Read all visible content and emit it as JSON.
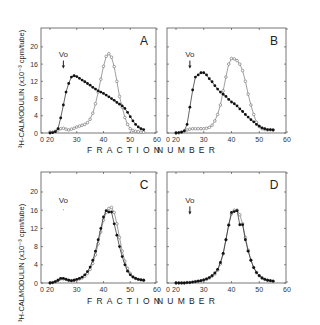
{
  "figure": {
    "xlabel_left": "FRACTION",
    "xlabel_right": "NUMBER",
    "ylabel": "³H-CALMODULIN (x10⁻³ cpm/tube)",
    "void_marker": "Vo"
  },
  "chart_data": [
    {
      "type": "line",
      "panel": "A",
      "title": "A",
      "xlabel": "FRACTION NUMBER",
      "ylabel": "3H-CALMODULIN (x10^-3 cpm/tube)",
      "xticks": [
        "0",
        "20",
        "30",
        "40",
        "50",
        "60"
      ],
      "yticks": [
        "0",
        "4",
        "8",
        "12",
        "16",
        "20"
      ],
      "xlim": [
        20,
        60
      ],
      "ylim": [
        0,
        24
      ],
      "annotation": {
        "text": "Vo",
        "x": 25,
        "arrow": true
      },
      "series": [
        {
          "name": "filled",
          "marker": "filled-circle",
          "x": [
            20,
            21,
            22,
            23,
            24,
            25,
            26,
            27,
            28,
            29,
            30,
            31,
            32,
            33,
            34,
            35,
            36,
            37,
            38,
            39,
            40,
            41,
            42,
            43,
            44,
            45,
            46,
            47,
            48,
            49,
            50,
            51,
            52,
            53,
            54,
            55
          ],
          "y": [
            0,
            0.1,
            0.3,
            1,
            3.5,
            6.5,
            9.5,
            11.5,
            13,
            13.3,
            13.1,
            12.7,
            12.3,
            11.9,
            11.5,
            11.1,
            10.6,
            10.2,
            9.8,
            9.5,
            9.2,
            8.8,
            8.4,
            8,
            7.6,
            7.1,
            6.7,
            6.3,
            5.7,
            4.8,
            3.8,
            2.8,
            2,
            1.4,
            1,
            0.8
          ]
        },
        {
          "name": "open",
          "marker": "open-circle",
          "x": [
            20,
            21,
            22,
            23,
            24,
            25,
            26,
            27,
            28,
            29,
            30,
            31,
            32,
            33,
            34,
            35,
            36,
            37,
            38,
            39,
            40,
            41,
            42,
            43,
            44,
            45,
            46,
            47,
            48,
            49,
            50,
            51,
            52,
            53,
            54,
            55
          ],
          "y": [
            0.2,
            0.2,
            0.4,
            0.7,
            1,
            1.1,
            0.9,
            0.7,
            0.9,
            1.1,
            1.4,
            1.6,
            1.8,
            2,
            2.4,
            3.2,
            4.6,
            6.8,
            9.5,
            12.5,
            15.5,
            17.8,
            18.4,
            17.6,
            15.4,
            12,
            8.5,
            6,
            3.6,
            2,
            1,
            0.6,
            0.4,
            0.3,
            0.2,
            0.2
          ]
        }
      ]
    },
    {
      "type": "line",
      "panel": "B",
      "title": "B",
      "xlabel": "FRACTION NUMBER",
      "xticks": [
        "0",
        "20",
        "30",
        "40",
        "50",
        "60"
      ],
      "xlim": [
        20,
        60
      ],
      "ylim": [
        0,
        24
      ],
      "annotation": {
        "text": "Vo",
        "x": 25,
        "arrow": true
      },
      "series": [
        {
          "name": "filled",
          "marker": "filled-circle",
          "x": [
            20,
            21,
            22,
            23,
            24,
            25,
            26,
            27,
            28,
            29,
            30,
            31,
            32,
            33,
            34,
            35,
            36,
            37,
            38,
            39,
            40,
            41,
            42,
            43,
            44,
            45,
            46,
            47,
            48,
            49,
            50,
            51,
            52,
            53,
            54,
            55
          ],
          "y": [
            0,
            0.1,
            0.2,
            0.5,
            2,
            6,
            10,
            13,
            13.5,
            14,
            14,
            13.5,
            12.6,
            11.9,
            11,
            10.2,
            9.5,
            9,
            8.5,
            7.8,
            7.2,
            6.8,
            6.3,
            5.6,
            5,
            4.3,
            3.7,
            3.1,
            2.6,
            2,
            1.6,
            1.2,
            1,
            0.8,
            0.8,
            0.7
          ]
        },
        {
          "name": "open",
          "marker": "open-circle",
          "x": [
            20,
            21,
            22,
            23,
            24,
            25,
            26,
            27,
            28,
            29,
            30,
            31,
            32,
            33,
            34,
            35,
            36,
            37,
            38,
            39,
            40,
            41,
            42,
            43,
            44,
            45,
            46,
            47,
            48,
            49,
            50,
            51,
            52,
            53,
            54,
            55
          ],
          "y": [
            0,
            0,
            0.2,
            0.4,
            0.7,
            0.9,
            1,
            1,
            1,
            1,
            1,
            1.1,
            1.3,
            1.8,
            2.8,
            4.3,
            6.5,
            9.8,
            13,
            16,
            17.3,
            17.2,
            16.8,
            16,
            14.5,
            12,
            9,
            6.5,
            4.3,
            2.5,
            1.5,
            1,
            0.8,
            0.7,
            0.7,
            0.7
          ]
        }
      ]
    },
    {
      "type": "line",
      "panel": "C",
      "title": "C",
      "xlabel": "FRACTION NUMBER",
      "ylabel": "3H-CALMODULIN (x10^-3 cpm/tube)",
      "xticks": [
        "0",
        "20",
        "30",
        "40",
        "50",
        "60"
      ],
      "yticks": [
        "0",
        "4",
        "8",
        "12",
        "16",
        "20"
      ],
      "xlim": [
        20,
        60
      ],
      "ylim": [
        0,
        24
      ],
      "annotation": {
        "text": "Vo",
        "x": 25,
        "arrow": false
      },
      "series": [
        {
          "name": "filled",
          "marker": "filled-circle",
          "x": [
            20,
            21,
            22,
            23,
            24,
            25,
            26,
            27,
            28,
            29,
            30,
            31,
            32,
            33,
            34,
            35,
            36,
            37,
            38,
            39,
            40,
            41,
            42,
            43,
            44,
            45,
            46,
            47,
            48,
            49,
            50,
            51,
            52,
            53,
            54,
            55
          ],
          "y": [
            0,
            0.1,
            0.3,
            0.6,
            1,
            1,
            0.8,
            0.6,
            0.5,
            0.6,
            0.8,
            1,
            1.3,
            1.8,
            2.5,
            3.5,
            5,
            7,
            9.5,
            12,
            14.5,
            15.9,
            15.6,
            15.6,
            13,
            10.5,
            8,
            5.8,
            4,
            2.6,
            1.8,
            1.3,
            1,
            0.8,
            0.7,
            0.6
          ]
        },
        {
          "name": "open",
          "marker": "open-circle",
          "x": [
            20,
            21,
            22,
            23,
            24,
            25,
            26,
            27,
            28,
            29,
            30,
            31,
            32,
            33,
            34,
            35,
            36,
            37,
            38,
            39,
            40,
            41,
            42,
            43,
            44,
            45,
            46,
            47,
            48,
            49,
            50,
            51,
            52,
            53,
            54,
            55
          ],
          "y": [
            0,
            0.1,
            0.3,
            0.6,
            0.9,
            0.9,
            0.8,
            0.6,
            0.5,
            0.6,
            0.7,
            0.9,
            1.1,
            1.5,
            2.1,
            3,
            4.3,
            6.2,
            8.6,
            11.2,
            13.8,
            15.5,
            16.4,
            16.6,
            15.5,
            13,
            10,
            7,
            4.8,
            3.2,
            2.1,
            1.4,
            1,
            0.8,
            0.7,
            0.6
          ]
        }
      ]
    },
    {
      "type": "line",
      "panel": "D",
      "title": "D",
      "xlabel": "FRACTION NUMBER",
      "xticks": [
        "0",
        "20",
        "30",
        "40",
        "50",
        "60"
      ],
      "xlim": [
        20,
        60
      ],
      "ylim": [
        0,
        24
      ],
      "annotation": {
        "text": "Vo",
        "x": 25,
        "arrow": true
      },
      "series": [
        {
          "name": "filled",
          "marker": "filled-circle",
          "x": [
            20,
            21,
            22,
            23,
            24,
            25,
            26,
            27,
            28,
            29,
            30,
            31,
            32,
            33,
            34,
            35,
            36,
            37,
            38,
            39,
            40,
            41,
            42,
            43,
            44,
            45,
            46,
            47,
            48,
            49,
            50,
            51,
            52,
            53,
            54,
            55
          ],
          "y": [
            0,
            0,
            0,
            0,
            0.1,
            0.1,
            0.2,
            0.3,
            0.4,
            0.5,
            0.7,
            0.9,
            1.2,
            1.6,
            2.2,
            3,
            4.5,
            6.5,
            9.5,
            12.7,
            15.5,
            15.7,
            15.9,
            12.8,
            12.8,
            9.5,
            7,
            5,
            3.4,
            2.3,
            1.6,
            1.1,
            0.8,
            0.6,
            0.5,
            0.4
          ]
        },
        {
          "name": "open",
          "marker": "open-circle",
          "x": [
            20,
            21,
            22,
            23,
            24,
            25,
            26,
            27,
            28,
            29,
            30,
            31,
            32,
            33,
            34,
            35,
            36,
            37,
            38,
            39,
            40,
            41,
            42,
            43,
            44,
            45,
            46,
            47,
            48,
            49,
            50,
            51,
            52,
            53,
            54,
            55
          ],
          "y": [
            0,
            0,
            0,
            0,
            0.1,
            0.1,
            0.2,
            0.3,
            0.4,
            0.5,
            0.6,
            0.8,
            1.1,
            1.5,
            2,
            2.8,
            4.2,
            6.4,
            9.5,
            12.8,
            15.2,
            16,
            16,
            15,
            13,
            10,
            7.2,
            5,
            3.4,
            2.3,
            1.6,
            1.1,
            0.8,
            0.6,
            0.5,
            0.4
          ]
        }
      ]
    }
  ]
}
